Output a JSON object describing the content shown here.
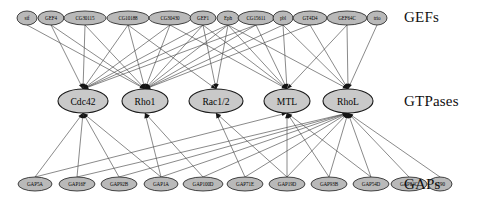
{
  "figure": {
    "type": "tripartite-network-diagram",
    "width": 483,
    "height": 205,
    "background": "#ffffff",
    "node_fill_small": "#b9b9b9",
    "node_fill_mid": "#c9c9c9",
    "node_stroke": "#1a1a1a",
    "edge_color": "#4a4a4a"
  },
  "row_labels": {
    "gefs": "GEFs",
    "gtpases": "GTPases",
    "gaps": "GAPs"
  },
  "gefs": [
    {
      "label": "sif",
      "cx": 27,
      "cy": 18,
      "rx": 10,
      "ry": 7
    },
    {
      "label": "GEF4",
      "cx": 51,
      "cy": 18,
      "rx": 13,
      "ry": 7
    },
    {
      "label": "CG30115",
      "cx": 85,
      "cy": 18,
      "rx": 21,
      "ry": 7
    },
    {
      "label": "CG10188",
      "cx": 128,
      "cy": 18,
      "rx": 21,
      "ry": 7
    },
    {
      "label": "CG30430",
      "cx": 170,
      "cy": 18,
      "rx": 21,
      "ry": 7
    },
    {
      "label": "GEF1",
      "cx": 203,
      "cy": 18,
      "rx": 13,
      "ry": 7
    },
    {
      "label": "Eph",
      "cx": 228,
      "cy": 18,
      "rx": 11,
      "ry": 7
    },
    {
      "label": "CG15611",
      "cx": 256,
      "cy": 18,
      "rx": 18,
      "ry": 7
    },
    {
      "label": "pbl",
      "cx": 283,
      "cy": 18,
      "rx": 10,
      "ry": 7
    },
    {
      "label": "GT4D4",
      "cx": 310,
      "cy": 18,
      "rx": 17,
      "ry": 7
    },
    {
      "label": "GEF64C",
      "cx": 347,
      "cy": 18,
      "rx": 20,
      "ry": 7
    },
    {
      "label": "trio",
      "cx": 377,
      "cy": 18,
      "rx": 10,
      "ry": 7
    }
  ],
  "gtpases": [
    {
      "label": "Cdc42",
      "cx": 83,
      "cy": 101,
      "rx": 25,
      "ry": 12
    },
    {
      "label": "Rho1",
      "cx": 145,
      "cy": 101,
      "rx": 23,
      "ry": 12
    },
    {
      "label": "Rac1/2",
      "cx": 216,
      "cy": 101,
      "rx": 27,
      "ry": 12
    },
    {
      "label": "MTL",
      "cx": 287,
      "cy": 101,
      "rx": 23,
      "ry": 12
    },
    {
      "label": "RhoL",
      "cx": 348,
      "cy": 101,
      "rx": 25,
      "ry": 12
    }
  ],
  "gaps": [
    {
      "label": "GAP5A",
      "cx": 35,
      "cy": 184,
      "rx": 17,
      "ry": 7
    },
    {
      "label": "GAP16F",
      "cx": 77,
      "cy": 184,
      "rx": 18,
      "ry": 7
    },
    {
      "label": "GAP92B",
      "cx": 119,
      "cy": 184,
      "rx": 18,
      "ry": 7
    },
    {
      "label": "GAP1A",
      "cx": 161,
      "cy": 184,
      "rx": 17,
      "ry": 7
    },
    {
      "label": "GAP100D",
      "cx": 203,
      "cy": 184,
      "rx": 20,
      "ry": 7
    },
    {
      "label": "GAP71E",
      "cx": 245,
      "cy": 184,
      "rx": 18,
      "ry": 7
    },
    {
      "label": "GAP19D",
      "cx": 287,
      "cy": 184,
      "rx": 18,
      "ry": 7
    },
    {
      "label": "GAP93B",
      "cx": 329,
      "cy": 184,
      "rx": 18,
      "ry": 7
    },
    {
      "label": "GAP54D",
      "cx": 371,
      "cy": 184,
      "rx": 18,
      "ry": 7
    },
    {
      "label": "GAP84C",
      "cx": 409,
      "cy": 184,
      "rx": 18,
      "ry": 7
    },
    {
      "label": "p190",
      "cx": 440,
      "cy": 184,
      "rx": 12,
      "ry": 7
    }
  ],
  "edges_gef_to_gtpase": [
    {
      "from": "sif",
      "to": "Rho1"
    },
    {
      "from": "GEF4",
      "to": "Cdc42"
    },
    {
      "from": "GEF4",
      "to": "Rho1"
    },
    {
      "from": "CG30115",
      "to": "Cdc42"
    },
    {
      "from": "CG30115",
      "to": "Rho1"
    },
    {
      "from": "CG10188",
      "to": "Cdc42"
    },
    {
      "from": "CG10188",
      "to": "Rho1"
    },
    {
      "from": "CG10188",
      "to": "Rac1/2"
    },
    {
      "from": "CG30430",
      "to": "Cdc42"
    },
    {
      "from": "CG30430",
      "to": "Rho1"
    },
    {
      "from": "CG30430",
      "to": "MTL"
    },
    {
      "from": "GEF1",
      "to": "Cdc42"
    },
    {
      "from": "GEF1",
      "to": "Rho1"
    },
    {
      "from": "GEF1",
      "to": "Rac1/2"
    },
    {
      "from": "GEF1",
      "to": "MTL"
    },
    {
      "from": "Eph",
      "to": "Cdc42"
    },
    {
      "from": "Eph",
      "to": "Rho1"
    },
    {
      "from": "Eph",
      "to": "Rac1/2"
    },
    {
      "from": "Eph",
      "to": "MTL"
    },
    {
      "from": "Eph",
      "to": "RhoL"
    },
    {
      "from": "CG15611",
      "to": "Cdc42"
    },
    {
      "from": "CG15611",
      "to": "Rho1"
    },
    {
      "from": "CG15611",
      "to": "MTL"
    },
    {
      "from": "pbl",
      "to": "Rho1"
    },
    {
      "from": "pbl",
      "to": "MTL"
    },
    {
      "from": "pbl",
      "to": "RhoL"
    },
    {
      "from": "GT4D4",
      "to": "Rho1"
    },
    {
      "from": "GT4D4",
      "to": "RhoL"
    },
    {
      "from": "GEF64C",
      "to": "MTL"
    },
    {
      "from": "GEF64C",
      "to": "RhoL"
    },
    {
      "from": "trio",
      "to": "RhoL"
    }
  ],
  "edges_gap_to_gtpase": [
    {
      "from": "GAP5A",
      "to": "Cdc42"
    },
    {
      "from": "GAP5A",
      "to": "MTL"
    },
    {
      "from": "GAP16F",
      "to": "Cdc42"
    },
    {
      "from": "GAP16F",
      "to": "RhoL"
    },
    {
      "from": "GAP92B",
      "to": "Cdc42"
    },
    {
      "from": "GAP92B",
      "to": "RhoL"
    },
    {
      "from": "GAP1A",
      "to": "Cdc42"
    },
    {
      "from": "GAP1A",
      "to": "Rho1"
    },
    {
      "from": "GAP1A",
      "to": "RhoL"
    },
    {
      "from": "GAP100D",
      "to": "Rho1"
    },
    {
      "from": "GAP100D",
      "to": "RhoL"
    },
    {
      "from": "GAP71E",
      "to": "Rac1/2"
    },
    {
      "from": "GAP71E",
      "to": "RhoL"
    },
    {
      "from": "GAP19D",
      "to": "Rac1/2"
    },
    {
      "from": "GAP19D",
      "to": "MTL"
    },
    {
      "from": "GAP19D",
      "to": "RhoL"
    },
    {
      "from": "GAP93B",
      "to": "MTL"
    },
    {
      "from": "GAP93B",
      "to": "RhoL"
    },
    {
      "from": "GAP54D",
      "to": "MTL"
    },
    {
      "from": "GAP54D",
      "to": "RhoL"
    },
    {
      "from": "GAP84C",
      "to": "RhoL"
    },
    {
      "from": "p190",
      "to": "RhoL"
    }
  ]
}
